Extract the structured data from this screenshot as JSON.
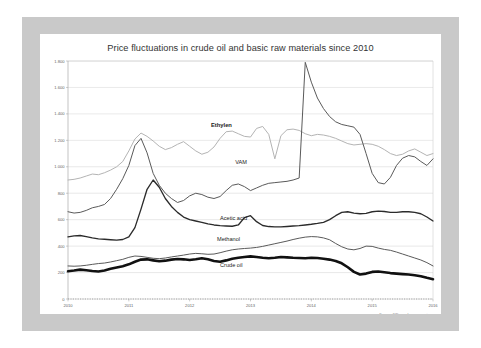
{
  "chart_data": {
    "type": "line",
    "title": "Price fluctuations in crude oil and basic raw materials since 2010",
    "xlabel": "",
    "ylabel": "",
    "grid": true,
    "legend_position": "inline-labels",
    "source": "Source: IVK member companies",
    "ylim": [
      0,
      1800
    ],
    "yticks": [
      0,
      200,
      400,
      600,
      800,
      1000,
      1200,
      1400,
      1600,
      1800
    ],
    "ytick_labels": [
      "0",
      "200",
      "400",
      "600",
      "800",
      "1.000",
      "1.200",
      "1.400",
      "1.600",
      "1.800"
    ],
    "xlim": [
      2010,
      2016
    ],
    "xticks": [
      2010,
      2011,
      2012,
      2013,
      2014,
      2015,
      2016
    ],
    "xtick_labels": [
      "2010",
      "2011",
      "2012",
      "2013",
      "2014",
      "2015",
      "2016"
    ],
    "x": [
      2010.0,
      2010.1,
      2010.2,
      2010.3,
      2010.4,
      2010.5,
      2010.6,
      2010.7,
      2010.8,
      2010.9,
      2011.0,
      2011.1,
      2011.2,
      2011.3,
      2011.4,
      2011.5,
      2011.6,
      2011.7,
      2011.8,
      2011.9,
      2012.0,
      2012.1,
      2012.2,
      2012.3,
      2012.4,
      2012.5,
      2012.6,
      2012.7,
      2012.8,
      2012.9,
      2013.0,
      2013.1,
      2013.2,
      2013.3,
      2013.4,
      2013.5,
      2013.6,
      2013.7,
      2013.8,
      2013.9,
      2014.0,
      2014.1,
      2014.2,
      2014.3,
      2014.4,
      2014.5,
      2014.6,
      2014.7,
      2014.8,
      2014.9,
      2015.0,
      2015.1,
      2015.2,
      2015.3,
      2015.4,
      2015.5,
      2015.6,
      2015.7,
      2015.8,
      2015.9,
      2016.0
    ],
    "series": [
      {
        "name": "Ethylen",
        "color": "#b4b4b4",
        "width": 1.0,
        "label_x": 2012.35,
        "label_y": 1300,
        "bold_label": true,
        "values": [
          900,
          905,
          915,
          930,
          945,
          940,
          955,
          975,
          1000,
          1040,
          1120,
          1210,
          1255,
          1230,
          1195,
          1155,
          1130,
          1145,
          1170,
          1190,
          1155,
          1120,
          1095,
          1110,
          1150,
          1215,
          1265,
          1270,
          1250,
          1230,
          1225,
          1290,
          1305,
          1245,
          1060,
          1235,
          1280,
          1285,
          1275,
          1250,
          1235,
          1245,
          1240,
          1230,
          1215,
          1195,
          1175,
          1165,
          1170,
          1175,
          1170,
          1155,
          1130,
          1100,
          1085,
          1095,
          1120,
          1135,
          1110,
          1085,
          1100
        ]
      },
      {
        "name": "VAM",
        "color": "#5a5a5a",
        "width": 1.0,
        "label_x": 2012.75,
        "label_y": 1020,
        "bold_label": false,
        "values": [
          660,
          650,
          655,
          670,
          690,
          700,
          715,
          760,
          830,
          910,
          1010,
          1160,
          1215,
          1105,
          950,
          860,
          800,
          760,
          730,
          745,
          780,
          800,
          790,
          770,
          760,
          775,
          820,
          860,
          870,
          850,
          820,
          840,
          860,
          875,
          880,
          885,
          890,
          900,
          915,
          1790,
          1640,
          1520,
          1440,
          1380,
          1340,
          1320,
          1310,
          1300,
          1245,
          1100,
          950,
          880,
          870,
          920,
          1010,
          1065,
          1085,
          1075,
          1040,
          1010,
          1060
        ]
      },
      {
        "name": "Acetic acid",
        "color": "#2b2b2b",
        "width": 1.35,
        "label_x": 2012.5,
        "label_y": 600,
        "bold_label": false,
        "values": [
          470,
          478,
          480,
          472,
          462,
          455,
          452,
          448,
          445,
          450,
          470,
          540,
          680,
          830,
          900,
          845,
          760,
          700,
          655,
          620,
          600,
          590,
          580,
          568,
          560,
          555,
          552,
          550,
          560,
          615,
          630,
          585,
          556,
          548,
          545,
          545,
          548,
          552,
          555,
          560,
          565,
          572,
          580,
          600,
          630,
          655,
          660,
          650,
          645,
          648,
          660,
          665,
          662,
          655,
          655,
          660,
          660,
          655,
          645,
          620,
          590
        ]
      },
      {
        "name": "Methanol",
        "color": "#5a5a5a",
        "width": 1.0,
        "label_x": 2012.45,
        "label_y": 440,
        "bold_label": false,
        "values": [
          250,
          248,
          250,
          255,
          262,
          268,
          272,
          280,
          290,
          300,
          315,
          325,
          322,
          315,
          308,
          305,
          310,
          318,
          325,
          332,
          340,
          345,
          342,
          338,
          340,
          350,
          362,
          372,
          378,
          382,
          385,
          390,
          398,
          408,
          418,
          428,
          438,
          450,
          460,
          468,
          472,
          470,
          462,
          448,
          420,
          395,
          378,
          372,
          382,
          400,
          398,
          385,
          375,
          368,
          355,
          340,
          325,
          310,
          295,
          275,
          250
        ]
      },
      {
        "name": "Crude oil",
        "color": "#111111",
        "width": 2.6,
        "label_x": 2012.5,
        "label_y": 245,
        "bold_label": false,
        "values": [
          210,
          215,
          222,
          218,
          212,
          208,
          215,
          228,
          238,
          248,
          262,
          282,
          298,
          300,
          292,
          285,
          290,
          298,
          302,
          300,
          295,
          300,
          308,
          300,
          288,
          282,
          292,
          305,
          312,
          318,
          322,
          318,
          312,
          308,
          312,
          318,
          315,
          312,
          310,
          308,
          312,
          310,
          305,
          298,
          288,
          270,
          240,
          205,
          185,
          192,
          205,
          208,
          202,
          196,
          192,
          188,
          185,
          180,
          172,
          160,
          150
        ]
      }
    ]
  }
}
